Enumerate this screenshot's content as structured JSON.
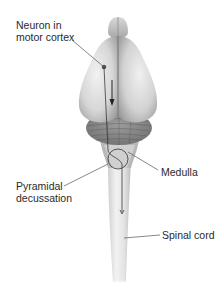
{
  "diagram": {
    "title": "",
    "labels": {
      "neuron_line1": "Neuron in",
      "neuron_line2": "motor cortex",
      "medulla": "Medulla",
      "pyramidal_line1": "Pyramidal",
      "pyramidal_line2": "decussation",
      "spinal_cord": "Spinal cord"
    },
    "colors": {
      "brain_light": "#e8e8e8",
      "brain_mid": "#c4c4c4",
      "brain_dark": "#8a8a8a",
      "leader_line": "#555555",
      "text": "#2a2a2a"
    }
  }
}
